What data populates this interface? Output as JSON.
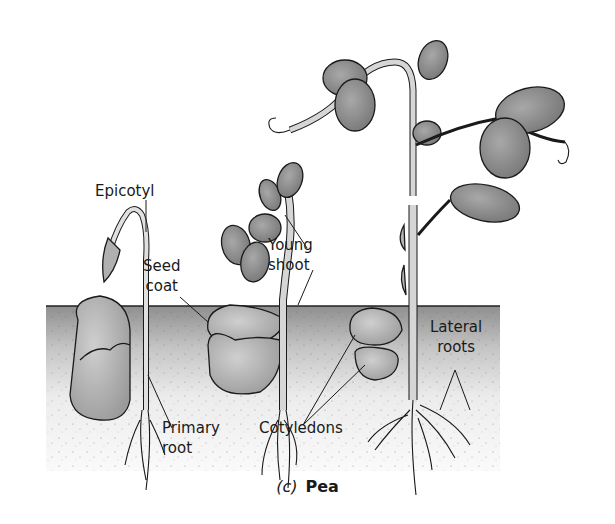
{
  "figure": {
    "panel_letter": "(c)",
    "panel_name": "Pea",
    "colors": {
      "soil_top": "#9a9a9a",
      "soil_bottom": "#f6f6f6",
      "leaf_fill": "#8c8c8c",
      "stem_fill": "#d9d9d9",
      "cotyledon_fill": "#b8b8b8",
      "outline": "#1a1a1a"
    },
    "stages": [
      {
        "name": "early-seedling",
        "description": "Hooked epicotyl emerging above soil"
      },
      {
        "name": "middle-seedling",
        "description": "Young shoot with first leaves"
      },
      {
        "name": "mature-seedling",
        "description": "Tall plant with tendrils and lateral roots"
      }
    ],
    "labels": {
      "epicotyl": "Epicotyl",
      "seed_coat_line1": "Seed",
      "seed_coat_line2": "coat",
      "young_shoot_line1": "Young",
      "young_shoot_line2": "shoot",
      "primary_root_line1": "Primary",
      "primary_root_line2": "root",
      "cotyledons": "Cotyledons",
      "lateral_roots_line1": "Lateral",
      "lateral_roots_line2": "roots"
    }
  }
}
